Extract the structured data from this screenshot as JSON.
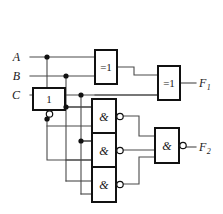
{
  "diagram": {
    "stroke_color": "#4a4a4a",
    "box_color": "#111111",
    "background": "#ffffff",
    "width": 223,
    "height": 214
  },
  "inputs": [
    {
      "label": "A",
      "x": 20,
      "y": 57
    },
    {
      "label": "B",
      "x": 20,
      "y": 76
    },
    {
      "label": "C",
      "x": 20,
      "y": 95
    }
  ],
  "outputs": [
    {
      "label": "F",
      "sub": "1",
      "x": 199,
      "y": 83
    },
    {
      "label": "F",
      "sub": "2",
      "x": 199,
      "y": 147
    }
  ],
  "gates": [
    {
      "id": "inv1",
      "symbol": "1",
      "kind": "not",
      "x": 33,
      "y": 88,
      "w": 32,
      "h": 22,
      "bubble": "bottom"
    },
    {
      "id": "xor1",
      "symbol": "=1",
      "kind": "xor",
      "x": 95,
      "y": 50,
      "w": 22,
      "h": 34,
      "bubble": "none"
    },
    {
      "id": "xor2",
      "symbol": "=1",
      "kind": "xor",
      "x": 158,
      "y": 66,
      "w": 22,
      "h": 34,
      "bubble": "none"
    },
    {
      "id": "nand1",
      "symbol": "&",
      "kind": "nand",
      "x": 92,
      "y": 99,
      "w": 24,
      "h": 35,
      "bubble": "right"
    },
    {
      "id": "nand2",
      "symbol": "&",
      "kind": "nand",
      "x": 92,
      "y": 133,
      "w": 24,
      "h": 35,
      "bubble": "right"
    },
    {
      "id": "nand3",
      "symbol": "&",
      "kind": "nand",
      "x": 92,
      "y": 167,
      "w": 24,
      "h": 35,
      "bubble": "right"
    },
    {
      "id": "nand4",
      "symbol": "&",
      "kind": "nand",
      "x": 155,
      "y": 128,
      "w": 24,
      "h": 35,
      "bubble": "right"
    }
  ],
  "junction_dots": [
    {
      "x": 47,
      "y": 57
    },
    {
      "x": 66,
      "y": 76
    },
    {
      "x": 81,
      "y": 95
    },
    {
      "x": 66,
      "y": 107
    },
    {
      "x": 47,
      "y": 119
    },
    {
      "x": 81,
      "y": 141
    }
  ],
  "wires": [
    {
      "name": "a-bus",
      "d": "M 30 57 L 95 57"
    },
    {
      "name": "b-bus",
      "d": "M 30 76 L 95 76"
    },
    {
      "name": "c-bus",
      "d": "M 30 95 L 158 95"
    },
    {
      "name": "a-branch-down",
      "d": "M 47 57 L 47 88"
    },
    {
      "name": "a-branch-lower",
      "d": "M 47 119 L 47 160 L 92 160"
    },
    {
      "name": "b-branch-down",
      "d": "M 66 76 L 66 181"
    },
    {
      "name": "b-to-nand3",
      "d": "M 66 181 L 92 181"
    },
    {
      "name": "c-branch-down",
      "d": "M 81 95 L 81 194"
    },
    {
      "name": "c-to-nand3",
      "d": "M 81 194 L 92 194"
    },
    {
      "name": "inv-out-down",
      "d": "M 49 110 L 49 119"
    },
    {
      "name": "inv-bus-right",
      "d": "M 66 107 L 92 107"
    },
    {
      "name": "inv-bus-mid",
      "d": "M 81 141 L 92 141"
    },
    {
      "name": "nand1-in-top",
      "d": "M 66 107 L 92 107"
    },
    {
      "name": "nand1-in-bot",
      "d": "M 47 126 L 92 126"
    },
    {
      "name": "nand2-in-top",
      "d": "M 81 141 L 92 141"
    },
    {
      "name": "nand2-in-bot",
      "d": "M 66 160 L 92 160"
    },
    {
      "name": "xor1-out",
      "d": "M 117 67 L 134 67 L 134 75 L 158 75"
    },
    {
      "name": "xor2-in-bot",
      "d": "M 95 95 L 158 95"
    },
    {
      "name": "f1-out",
      "d": "M 180 83 L 196 83"
    },
    {
      "name": "nand1-out",
      "d": "M 121 116 L 139 116 L 139 136 L 155 136"
    },
    {
      "name": "nand2-out",
      "d": "M 121 150 L 155 150"
    },
    {
      "name": "nand3-out",
      "d": "M 121 184 L 139 184 L 139 157 L 155 157"
    },
    {
      "name": "f2-out",
      "d": "M 184 147 L 196 147"
    }
  ]
}
